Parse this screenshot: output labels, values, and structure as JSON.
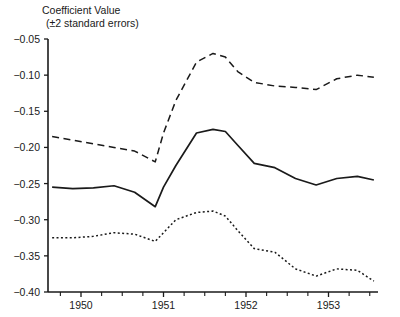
{
  "chart_data": {
    "type": "line",
    "title": "Coefficient Value",
    "subtitle": "(±2 standard errors)",
    "xlabel": "",
    "ylabel": "Coefficient Value (±2 standard errors)",
    "xlim": [
      1949.6,
      1953.6
    ],
    "ylim": [
      -0.4,
      -0.05
    ],
    "grid": false,
    "legend_position": "none",
    "y_ticks": [
      -0.05,
      -0.1,
      -0.15,
      -0.2,
      -0.25,
      -0.3,
      -0.35,
      -0.4
    ],
    "y_tick_labels": [
      "−0.05",
      "−0.10",
      "−0.15",
      "−0.20",
      "−0.25",
      "−0.30",
      "−0.35",
      "−0.40"
    ],
    "x_ticks": [
      1950,
      1951,
      1952,
      1953
    ],
    "x_tick_labels": [
      "1950",
      "1951",
      "1952",
      "1953"
    ],
    "x_minor_ticks": [
      1949.75,
      1950.25,
      1950.5,
      1950.75,
      1951.25,
      1951.5,
      1951.75,
      1952.25,
      1952.5,
      1952.75,
      1953.25,
      1953.5
    ],
    "x": [
      1949.65,
      1949.9,
      1950.15,
      1950.4,
      1950.65,
      1950.9,
      1951.0,
      1951.15,
      1951.4,
      1951.6,
      1951.75,
      1951.9,
      1952.1,
      1952.35,
      1952.6,
      1952.85,
      1953.1,
      1953.35,
      1953.55
    ],
    "series": [
      {
        "name": "Upper bound (+2 SE)",
        "style": "dashed",
        "values": [
          -0.185,
          -0.19,
          -0.195,
          -0.2,
          -0.205,
          -0.22,
          -0.18,
          -0.135,
          -0.082,
          -0.07,
          -0.075,
          -0.095,
          -0.11,
          -0.115,
          -0.117,
          -0.12,
          -0.105,
          -0.1,
          -0.103
        ]
      },
      {
        "name": "Point estimate",
        "style": "solid",
        "values": [
          -0.255,
          -0.257,
          -0.256,
          -0.253,
          -0.262,
          -0.282,
          -0.255,
          -0.225,
          -0.18,
          -0.175,
          -0.178,
          -0.197,
          -0.222,
          -0.228,
          -0.243,
          -0.252,
          -0.243,
          -0.24,
          -0.245
        ]
      },
      {
        "name": "Lower bound (−2 SE)",
        "style": "dotted",
        "values": [
          -0.325,
          -0.325,
          -0.323,
          -0.318,
          -0.32,
          -0.33,
          -0.318,
          -0.3,
          -0.29,
          -0.288,
          -0.295,
          -0.315,
          -0.34,
          -0.345,
          -0.368,
          -0.378,
          -0.368,
          -0.37,
          -0.385
        ]
      }
    ]
  }
}
